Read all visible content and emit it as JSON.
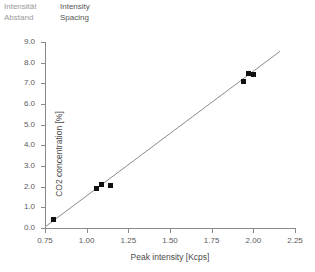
{
  "legend": {
    "rows": [
      {
        "de": "Intensität",
        "en": "Intensity"
      },
      {
        "de": "Abstand",
        "en": "Spacing"
      }
    ]
  },
  "chart_data": {
    "type": "scatter",
    "title": "",
    "xlabel": "Peak intensity  [Kcps]",
    "ylabel": "CO2 concentration  [%]",
    "xlim": [
      0.75,
      2.25
    ],
    "ylim": [
      0.0,
      9.0
    ],
    "xticks": [
      "0.75",
      "1.00",
      "1.25",
      "1.50",
      "1.75",
      "2.00",
      "2.25"
    ],
    "xtick_values": [
      0.75,
      1.0,
      1.25,
      1.5,
      1.75,
      2.0,
      2.25
    ],
    "yticks": [
      "0.0",
      "1.0",
      "2.0",
      "3.0",
      "4.0",
      "5.0",
      "6.0",
      "7.0",
      "8.0",
      "9.0"
    ],
    "ytick_values": [
      0.0,
      1.0,
      2.0,
      3.0,
      4.0,
      5.0,
      6.0,
      7.0,
      8.0,
      9.0
    ],
    "grid": false,
    "legend_position": "none",
    "marker_color": "#111111",
    "line_color": "#8a8a8a",
    "axis_color": "#8a8a8a",
    "points": [
      {
        "x": 0.8,
        "y": 0.4
      },
      {
        "x": 1.06,
        "y": 1.9
      },
      {
        "x": 1.09,
        "y": 2.1
      },
      {
        "x": 1.14,
        "y": 2.05
      },
      {
        "x": 1.94,
        "y": 7.1
      },
      {
        "x": 1.97,
        "y": 7.5
      },
      {
        "x": 2.0,
        "y": 7.45
      }
    ],
    "fit_line": {
      "x0": 0.75,
      "y0": 0.05,
      "x1": 2.16,
      "y1": 8.55
    }
  }
}
